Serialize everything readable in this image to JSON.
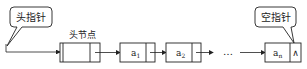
{
  "diagram": {
    "type": "singly-linked-list-with-head-node",
    "callouts": {
      "head_pointer": "头指针",
      "null_pointer": "空指针"
    },
    "head_node_label": "头节点",
    "nodes": [
      {
        "data": "a",
        "sub": "1"
      },
      {
        "data": "a",
        "sub": "2"
      },
      {
        "data": "a",
        "sub": "n"
      }
    ],
    "ellipsis": "…",
    "null_symbol": "∧",
    "colors": {
      "stroke": "#222222",
      "background": "#ffffff"
    }
  }
}
